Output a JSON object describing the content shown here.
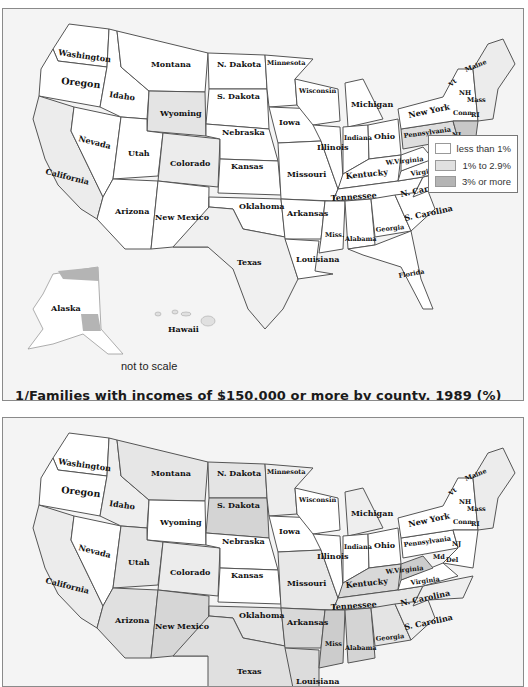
{
  "maps": [
    {
      "id": "top",
      "caption": "1/Families with incomes of $150,000 or more by county, 1989 (%)",
      "note": "not to scale",
      "legend": [
        {
          "label": "less than 1%",
          "color": "#ffffff"
        },
        {
          "label": "1% to 2.9%",
          "color": "#e0e0e0"
        },
        {
          "label": "3% or more",
          "color": "#b4b4b4"
        }
      ]
    },
    {
      "id": "bottom",
      "caption": "",
      "note": ""
    }
  ],
  "state_labels": {
    "washington": "Washington",
    "oregon": "Oregon",
    "california": "California",
    "idaho": "Idaho",
    "nevada": "Nevada",
    "montana": "Montana",
    "wyoming": "Wyoming",
    "utah": "Utah",
    "colorado": "Colorado",
    "arizona": "Arizona",
    "new_mexico": "New Mexico",
    "n_dakota": "N. Dakota",
    "s_dakota": "S. Dakota",
    "nebraska": "Nebraska",
    "kansas": "Kansas",
    "oklahoma": "Oklahoma",
    "texas": "Texas",
    "minnesota": "Minnesota",
    "iowa": "Iowa",
    "missouri": "Missouri",
    "arkansas": "Arkansas",
    "louisiana": "Louisiana",
    "wisconsin": "Wisconsin",
    "illinois": "Illinois",
    "michigan": "Michigan",
    "indiana": "Indiana",
    "ohio": "Ohio",
    "kentucky": "Kentucky",
    "tennessee": "Tennessee",
    "miss": "Miss.",
    "miss_bottom": "Miss",
    "alabama": "Alabama",
    "georgia": "Georgia",
    "florida": "Florida",
    "s_carolina": "S. Carolina",
    "n_carolina": "N. Carolina",
    "virginia": "Virginia",
    "w_virginia": "W.Virginia",
    "pennsylvania": "Pennsylvania",
    "new_york": "New York",
    "maine": "Maine",
    "vt": "Vt",
    "nh": "NH",
    "mass": "Mass",
    "conn": "Conn",
    "ri": "RI",
    "nj": "NJ",
    "del": "Del",
    "md": "Md",
    "alaska": "Alaska",
    "hawaii": "Hawaii"
  },
  "colors": {
    "panel_bg": "#f4f4f4",
    "low": "#ffffff",
    "mid": "#e0e0e0",
    "high": "#b4b4b4",
    "border": "#555555"
  }
}
